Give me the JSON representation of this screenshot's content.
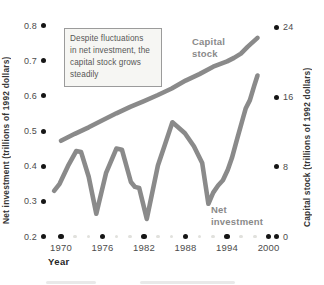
{
  "chart_data": {
    "type": "line",
    "title": "",
    "xlabel": "Year",
    "xlim": [
      1969,
      2000
    ],
    "grid": false,
    "legend_position": "inline-labels",
    "x_ticks": [
      1970,
      1976,
      1982,
      1988,
      1994,
      2000
    ],
    "x_minor_ticks": [
      1972,
      1974,
      1978,
      1980,
      1984,
      1986,
      1990,
      1992,
      1996,
      1998
    ],
    "left_axis": {
      "label": "Net investment (trillions of 1992 dollars)",
      "ticks": [
        0.2,
        0.3,
        0.4,
        0.5,
        0.6,
        0.7,
        0.8
      ],
      "range": [
        0.2,
        0.8
      ]
    },
    "right_axis": {
      "label": "Capital stock (trillions of 1992 dollars)",
      "ticks": [
        0,
        8,
        16,
        24
      ],
      "range": [
        0,
        24
      ]
    },
    "annotation_lines": [
      "Despite fluctuations",
      "in net investment, the",
      "capital stock grows",
      "steadily"
    ],
    "series": [
      {
        "name": "Capital stock",
        "axis": "right",
        "color": "#8a8a8a",
        "points": [
          [
            1970,
            11.0
          ],
          [
            1972,
            11.8
          ],
          [
            1974,
            12.55
          ],
          [
            1976,
            13.35
          ],
          [
            1978,
            14.15
          ],
          [
            1980,
            14.9
          ],
          [
            1982,
            15.55
          ],
          [
            1984,
            16.25
          ],
          [
            1986,
            17.0
          ],
          [
            1988,
            17.9
          ],
          [
            1990,
            18.65
          ],
          [
            1992,
            19.5
          ],
          [
            1994,
            20.1
          ],
          [
            1995,
            20.5
          ],
          [
            1996,
            21.0
          ],
          [
            1997,
            21.8
          ],
          [
            1998.4,
            22.8
          ]
        ]
      },
      {
        "name": "Net investment",
        "axis": "left",
        "color": "#8a8a8a",
        "points": [
          [
            1969,
            0.33
          ],
          [
            1969.8,
            0.35
          ],
          [
            1971,
            0.4
          ],
          [
            1972.2,
            0.443
          ],
          [
            1972.9,
            0.44
          ],
          [
            1974,
            0.37
          ],
          [
            1975.1,
            0.265
          ],
          [
            1976.5,
            0.38
          ],
          [
            1978,
            0.45
          ],
          [
            1978.8,
            0.447
          ],
          [
            1980.1,
            0.355
          ],
          [
            1980.7,
            0.341
          ],
          [
            1981.3,
            0.338
          ],
          [
            1982.4,
            0.25
          ],
          [
            1984,
            0.402
          ],
          [
            1985,
            0.46
          ],
          [
            1986.1,
            0.525
          ],
          [
            1986.8,
            0.513
          ],
          [
            1987.9,
            0.494
          ],
          [
            1989.2,
            0.457
          ],
          [
            1990.4,
            0.409
          ],
          [
            1990.9,
            0.345
          ],
          [
            1991.3,
            0.293
          ],
          [
            1992,
            0.325
          ],
          [
            1992.7,
            0.345
          ],
          [
            1993.4,
            0.36
          ],
          [
            1994.1,
            0.39
          ],
          [
            1994.7,
            0.423
          ],
          [
            1995.4,
            0.474
          ],
          [
            1996.3,
            0.537
          ],
          [
            1996.7,
            0.565
          ],
          [
            1997.3,
            0.588
          ],
          [
            1997.9,
            0.628
          ],
          [
            1998.4,
            0.658
          ]
        ]
      }
    ]
  },
  "colors": {
    "curve": "#8a8a8a",
    "tick_dot": "#161616",
    "minor_tick_dot": "#e1e1dd",
    "tick_text": "#4c4c4c",
    "annotation_bg": "#f6f6f3",
    "annotation_border": "#9b9b9b"
  }
}
